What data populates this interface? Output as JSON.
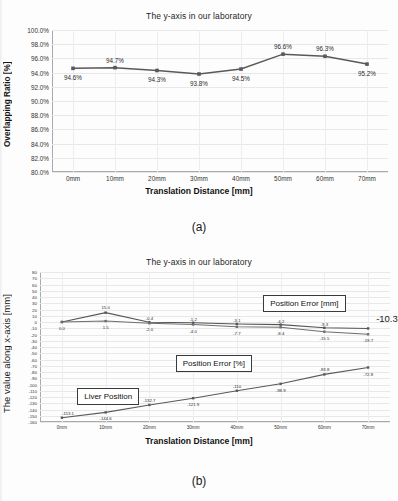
{
  "page": {
    "figure_a_caption": "(a)",
    "figure_b_caption": "(b)"
  },
  "chart_data": [
    {
      "id": "chart-a",
      "type": "line",
      "title": "The y-axis in our laboratory",
      "xlabel": "Translation Distance [mm]",
      "ylabel": "Overlapping Ratio [%]",
      "categories": [
        "0mm",
        "10mm",
        "20mm",
        "30mm",
        "40mm",
        "50mm",
        "60mm",
        "70mm"
      ],
      "values": [
        94.6,
        94.7,
        94.3,
        93.8,
        94.5,
        96.6,
        96.3,
        95.2
      ],
      "data_labels": [
        "94.6%",
        "94.7%",
        "94.3%",
        "93.8%",
        "94.5%",
        "96.6%",
        "96.3%",
        "95.2%"
      ],
      "ylim": [
        80.0,
        100.0
      ],
      "ytick_labels": [
        "100.0%",
        "98.0%",
        "96.0%",
        "94.0%",
        "92.0%",
        "90.0%",
        "88.0%",
        "86.0%",
        "84.0%",
        "82.0%",
        "80.0%"
      ],
      "ytick_values": [
        100,
        98,
        96,
        94,
        92,
        90,
        88,
        86,
        84,
        82,
        80
      ],
      "grid": true,
      "legend": "none",
      "series_color": "#595959"
    },
    {
      "id": "chart-b",
      "type": "line",
      "title": "The y-axis in our laboratory",
      "xlabel": "Translation Distance [mm]",
      "ylabel": "The value along x-axis  [mm]",
      "categories": [
        "0mm",
        "10mm",
        "20mm",
        "30mm",
        "40mm",
        "50mm",
        "60mm",
        "70mm"
      ],
      "ylim": [
        -160,
        80
      ],
      "ytick_labels": [
        "80",
        "70",
        "60",
        "50",
        "40",
        "30",
        "20",
        "10",
        "0",
        "-10",
        "-20",
        "-30",
        "-40",
        "-50",
        "-60",
        "-70",
        "-80",
        "-90",
        "-100",
        "-110",
        "-120",
        "-130",
        "-140",
        "-150",
        "-160"
      ],
      "ytick_values": [
        80,
        70,
        60,
        50,
        40,
        30,
        20,
        10,
        0,
        -10,
        -20,
        -30,
        -40,
        -50,
        -60,
        -70,
        -80,
        -90,
        -100,
        -110,
        -120,
        -130,
        -140,
        -150,
        -160
      ],
      "grid": true,
      "legend": "callout-boxes",
      "series": [
        {
          "name": "Position Error [mm]",
          "values": [
            0.0,
            15.0,
            -0.4,
            -1.2,
            -3.1,
            -4.2,
            -9.3,
            -10.3
          ],
          "data_labels": [
            "",
            "15.0",
            "-0.4",
            "-1.2",
            "-3.1",
            "-4.2",
            "-9.3",
            ""
          ],
          "color": "#555555"
        },
        {
          "name": "Position Error [%]",
          "values": [
            0.0,
            1.5,
            -2.0,
            -4.0,
            -7.7,
            -8.4,
            -15.5,
            -19.7
          ],
          "data_labels": [
            "0.0",
            "1.5",
            "-2.0",
            "-4.0",
            "-7.7",
            "-8.4",
            "-15.5",
            "-19.7"
          ],
          "color": "#6e6e6e"
        },
        {
          "name": "Liver Position",
          "values": [
            -153.1,
            -144.6,
            -132.7,
            -121.9,
            -110.0,
            -98.9,
            -83.8,
            -72.8
          ],
          "data_labels": [
            "-153.1",
            "-144.6",
            "-132.7",
            "-121.9",
            "-110",
            "-98.9",
            "-83.8",
            "-72.8"
          ],
          "color": "#5a5a5a"
        }
      ],
      "callouts": [
        {
          "name": "position-error-mm",
          "label": "Position Error [mm]"
        },
        {
          "name": "position-error-pct",
          "label": "Position Error [%]"
        },
        {
          "name": "liver-position",
          "label": "Liver Position"
        }
      ],
      "annotations": [
        {
          "name": "final-error-annotation",
          "label": "-10.3"
        }
      ]
    }
  ]
}
